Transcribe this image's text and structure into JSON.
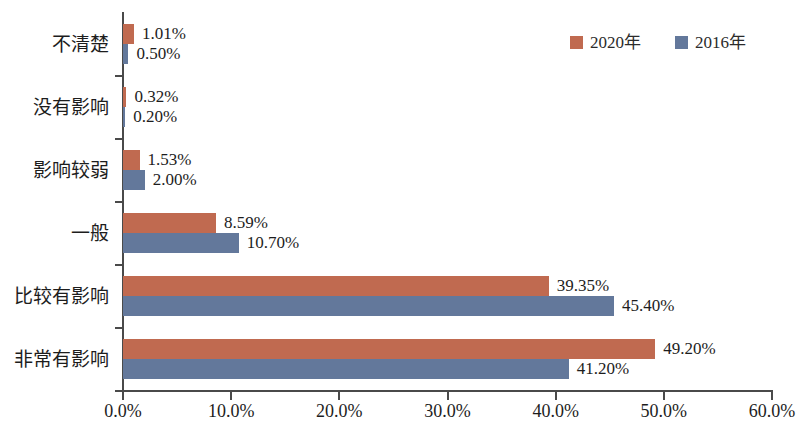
{
  "chart_data": {
    "type": "bar",
    "orientation": "horizontal",
    "title": "",
    "xlabel": "",
    "ylabel": "",
    "xlim": [
      0,
      60
    ],
    "x_tick_labels": [
      "0.0%",
      "10.0%",
      "20.0%",
      "30.0%",
      "40.0%",
      "50.0%",
      "60.0%"
    ],
    "x_tick_values": [
      0,
      10,
      20,
      30,
      40,
      50,
      60
    ],
    "grid": false,
    "legend_position": "top-right",
    "categories": [
      "不清楚",
      "没有影响",
      "影响较弱",
      "一般",
      "比较有影响",
      "非常有影响"
    ],
    "series": [
      {
        "name": "2020年",
        "color": "#c06a50",
        "values": [
          1.01,
          0.32,
          1.53,
          8.59,
          39.35,
          49.2
        ],
        "labels": [
          "1.01%",
          "0.32%",
          "1.53%",
          "8.59%",
          "39.35%",
          "49.20%"
        ]
      },
      {
        "name": "2016年",
        "color": "#63789b",
        "values": [
          0.5,
          0.2,
          2.0,
          10.7,
          45.4,
          41.2
        ],
        "labels": [
          "0.50%",
          "0.20%",
          "2.00%",
          "10.70%",
          "45.40%",
          "41.20%"
        ]
      }
    ]
  },
  "axis": {
    "line_color": "#4a4a4a"
  }
}
